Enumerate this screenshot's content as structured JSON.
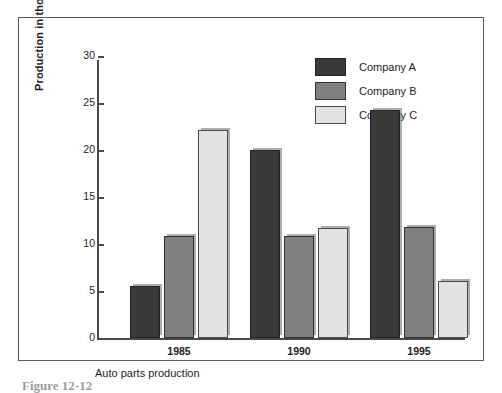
{
  "chart_data": {
    "type": "bar",
    "title": "",
    "xlabel": "Auto parts production",
    "ylabel": "Production in thousands",
    "categories": [
      "1985",
      "1990",
      "1995"
    ],
    "series": [
      {
        "name": "Company A",
        "color": "#3a3a3a",
        "values": [
          5.5,
          20.0,
          24.3
        ]
      },
      {
        "name": "Company B",
        "color": "#808080",
        "values": [
          10.9,
          10.8,
          11.8
        ]
      },
      {
        "name": "Company C",
        "color": "#e2e2e2",
        "values": [
          22.1,
          11.7,
          6.1
        ]
      }
    ],
    "ylim": [
      0,
      30
    ],
    "yticks": [
      0,
      5,
      10,
      15,
      20,
      25,
      30
    ],
    "ytick_labels": [
      "0",
      "5",
      "10",
      "15",
      "20",
      "25",
      "30"
    ],
    "grid": false,
    "legend_position": "top-right"
  },
  "figure": {
    "caption": "Figure 12-12"
  }
}
